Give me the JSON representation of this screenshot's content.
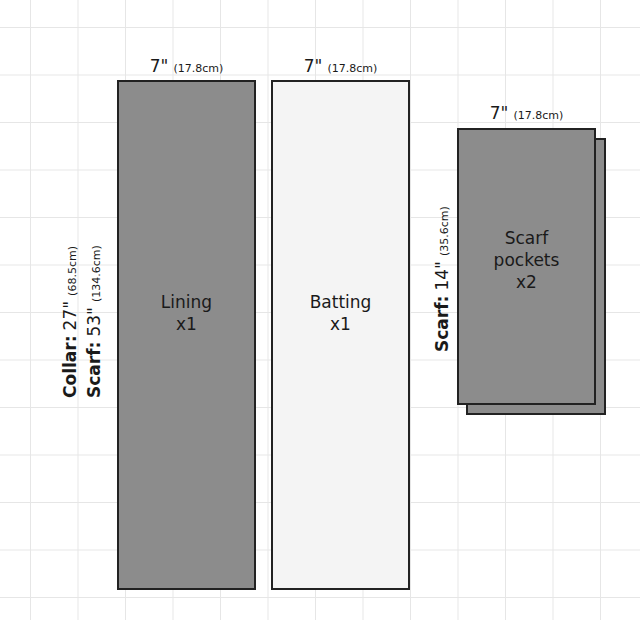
{
  "pieces": {
    "lining": {
      "name": "Lining",
      "qty": "x1",
      "width_in": "7\"",
      "width_cm": "(17.8cm)",
      "fill": "#8c8c8c"
    },
    "batting": {
      "name": "Batting",
      "qty": "x1",
      "width_in": "7\"",
      "width_cm": "(17.8cm)",
      "fill": "#f4f4f4"
    },
    "scarf_pockets": {
      "name_line1": "Scarf",
      "name_line2": "pockets",
      "qty": "x2",
      "width_in": "7\"",
      "width_cm": "(17.8cm)",
      "height_label": "Scarf:",
      "height_in": "14\"",
      "height_cm": "(35.6cm)",
      "fill": "#8c8c8c"
    }
  },
  "length_labels": {
    "collar": {
      "label": "Collar:",
      "inches": "27\"",
      "cm": "(68.5cm)"
    },
    "scarf": {
      "label": "Scarf:",
      "inches": "53\"",
      "cm": "(134.6cm)"
    }
  }
}
